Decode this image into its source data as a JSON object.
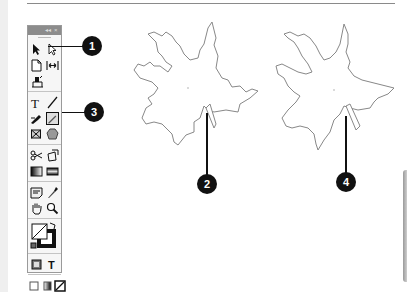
{
  "figure": {
    "callouts": [
      {
        "number": "1",
        "target": "direct-selection-tool"
      },
      {
        "number": "2",
        "target": "selected-path-leaf-1"
      },
      {
        "number": "3",
        "target": "pencil-tool"
      },
      {
        "number": "4",
        "target": "edited-path-leaf-2"
      }
    ]
  },
  "toolbox": {
    "title_controls": [
      "◂◂",
      "×"
    ],
    "tools": [
      [
        "selection",
        "direct-selection"
      ],
      [
        "page",
        "gap"
      ],
      [
        "content-collector"
      ],
      [
        "type",
        "line"
      ],
      [
        "pen",
        "pencil"
      ],
      [
        "rectangle-frame",
        "polygon"
      ],
      [
        "scissors",
        "free-transform"
      ],
      [
        "gradient-swatch",
        "gradient-feather"
      ],
      [
        "note",
        "eyedropper"
      ],
      [
        "hand",
        "zoom"
      ],
      [
        "fill-stroke"
      ],
      [
        "formatting-container",
        "formatting-text"
      ],
      [
        "apply-color",
        "apply-gradient",
        "apply-none"
      ],
      [
        "normal-view",
        "preview-view"
      ]
    ]
  }
}
